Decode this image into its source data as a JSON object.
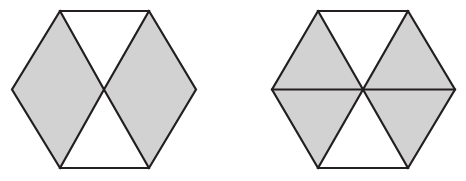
{
  "figure": {
    "width": 466,
    "height": 181,
    "background_color": "#ffffff",
    "stroke_color": "#231f20",
    "stroke_width": 2.2,
    "shaded_fill_color": "#d2d2d2",
    "unshaded_fill_color": "#ffffff"
  },
  "shapes": [
    {
      "id": "hexagon-left",
      "label": "Hexagon 1",
      "type": "hexagon",
      "orientation": "pointy-left-right",
      "center": {
        "x": 104,
        "y": 89.5
      },
      "vertices": [
        {
          "name": "top-left",
          "x": 60,
          "y": 11
        },
        {
          "name": "top-right",
          "x": 149,
          "y": 11
        },
        {
          "name": "right",
          "x": 196,
          "y": 89.5
        },
        {
          "name": "bottom-right",
          "x": 149,
          "y": 168
        },
        {
          "name": "bottom-left",
          "x": 60,
          "y": 168
        },
        {
          "name": "left",
          "x": 12,
          "y": 89.5
        }
      ],
      "subdivision": "two rhombi meeting at the center; top and bottom triangles",
      "internal_lines": [
        {
          "name": "diagonal-top-left-to-center-to-bottom-right",
          "points": "60,11 104,89.5 149,168"
        },
        {
          "name": "diagonal-top-right-to-center-to-bottom-left",
          "points": "149,11 104,89.5 60,168"
        }
      ],
      "regions": [
        {
          "name": "left-rhombus",
          "shaded": true,
          "points": "12,89.5 60,11 104,89.5 60,168"
        },
        {
          "name": "right-rhombus",
          "shaded": true,
          "points": "196,89.5 149,11 104,89.5 149,168"
        },
        {
          "name": "top-triangle",
          "shaded": false,
          "points": "60,11 149,11 104,89.5"
        },
        {
          "name": "bottom-triangle",
          "shaded": false,
          "points": "60,168 149,168 104,89.5"
        }
      ],
      "shaded_count": 2,
      "total_regions": 4,
      "shaded_fraction": "1/2"
    },
    {
      "id": "hexagon-right",
      "label": "Hexagon 2",
      "type": "hexagon",
      "orientation": "pointy-left-right",
      "center": {
        "x": 363,
        "y": 89.5
      },
      "vertices": [
        {
          "name": "top-left",
          "x": 318,
          "y": 11
        },
        {
          "name": "top-right",
          "x": 408,
          "y": 11
        },
        {
          "name": "right",
          "x": 455,
          "y": 89.5
        },
        {
          "name": "bottom-right",
          "x": 408,
          "y": 168
        },
        {
          "name": "bottom-left",
          "x": 318,
          "y": 168
        },
        {
          "name": "left",
          "x": 272,
          "y": 89.5
        }
      ],
      "subdivision": "six triangles formed by three main diagonals through the center",
      "internal_lines": [
        {
          "name": "horizontal-diagonal",
          "points": "272,89.5 455,89.5"
        },
        {
          "name": "diagonal-top-left-to-bottom-right",
          "points": "318,11 408,168"
        },
        {
          "name": "diagonal-top-right-to-bottom-left",
          "points": "408,11 318,168"
        }
      ],
      "regions": [
        {
          "name": "upper-left-triangle",
          "shaded": true,
          "points": "272,89.5 318,11 363,89.5"
        },
        {
          "name": "lower-left-triangle",
          "shaded": true,
          "points": "272,89.5 363,89.5 318,168"
        },
        {
          "name": "upper-right-triangle",
          "shaded": true,
          "points": "363,89.5 408,11 455,89.5"
        },
        {
          "name": "lower-right-triangle",
          "shaded": true,
          "points": "363,89.5 455,89.5 408,168"
        },
        {
          "name": "top-triangle",
          "shaded": false,
          "points": "318,11 408,11 363,89.5"
        },
        {
          "name": "bottom-triangle",
          "shaded": false,
          "points": "318,168 408,168 363,89.5"
        }
      ],
      "shaded_count": 4,
      "total_regions": 6,
      "shaded_fraction": "2/3"
    }
  ]
}
